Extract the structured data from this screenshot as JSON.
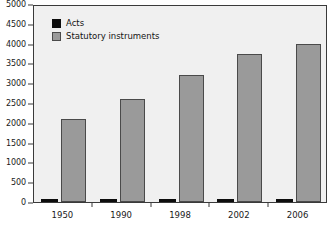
{
  "chart_data": {
    "type": "bar",
    "title": "",
    "subtitle": "",
    "xlabel": "",
    "ylabel": "",
    "categories": [
      "1950",
      "1990",
      "1998",
      "2002",
      "2006"
    ],
    "series": [
      {
        "name": "Acts",
        "color": "#0d0d0d",
        "values": [
          45,
          45,
          45,
          45,
          55
        ]
      },
      {
        "name": "Statutory instruments",
        "color": "#9a9a9a",
        "values": [
          2090,
          2590,
          3220,
          3740,
          4000
        ]
      }
    ],
    "ylim": [
      0,
      5000
    ],
    "ytick_labels": [
      "0",
      "500",
      "1000",
      "1500",
      "2000",
      "2500",
      "3000",
      "3500",
      "4000",
      "4500",
      "5000"
    ],
    "ytick_values": [
      0,
      500,
      1000,
      1500,
      2000,
      2500,
      3000,
      3500,
      4000,
      4500,
      5000
    ],
    "grid": false,
    "legend_position": "top-left",
    "plot_background": "#f0f0f0",
    "axis_color": "#3a3a3a"
  },
  "legend": {
    "entries": [
      {
        "label": "Acts"
      },
      {
        "label": "Statutory instruments"
      }
    ]
  }
}
